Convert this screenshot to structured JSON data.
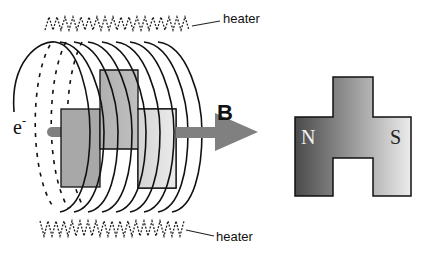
{
  "diagram": {
    "labels": {
      "heater_top": "heater",
      "heater_bottom": "heater",
      "electron": "e",
      "electron_charge": "-",
      "field": "B",
      "north": "N",
      "south": "S"
    },
    "colors": {
      "arrow": "#808080",
      "magnet_left": "#505050",
      "magnet_right": "#e6e6e6",
      "plate_center": "#bcbcbc",
      "plate_left": "#a8a8a8",
      "plate_right": "#dcdcdc",
      "stroke": "#111111"
    }
  }
}
